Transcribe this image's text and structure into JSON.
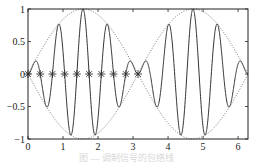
{
  "chart_data": {
    "type": "line",
    "title": "",
    "xlabel": "",
    "ylabel": "",
    "xlim": [
      0,
      6.2832
    ],
    "ylim": [
      -1,
      1
    ],
    "grid": false,
    "legend": null,
    "x_ticks": [
      0,
      1,
      2,
      3,
      4,
      5,
      6
    ],
    "x_tick_labels": [
      "0",
      "1",
      "2",
      "3",
      "4",
      "5",
      "6"
    ],
    "y_ticks": [
      -1,
      -0.5,
      0,
      0.5,
      1
    ],
    "y_tick_labels": [
      "−1",
      "−0.5",
      "0",
      "0.5",
      "1"
    ],
    "series": [
      {
        "name": "signal",
        "style": "solid",
        "color": "#333333",
        "formula": "sin(x)*sin(9x)",
        "sampled_points": [
          [
            0,
            0
          ],
          [
            0.17,
            0.17
          ],
          [
            0.52,
            -0.5
          ],
          [
            0.87,
            0.77
          ],
          [
            1.22,
            -0.94
          ],
          [
            1.57,
            1.0
          ],
          [
            1.92,
            -0.94
          ],
          [
            2.27,
            0.77
          ],
          [
            2.62,
            -0.5
          ],
          [
            2.97,
            0.17
          ],
          [
            3.14,
            0
          ],
          [
            3.32,
            0.17
          ],
          [
            3.67,
            -0.5
          ],
          [
            4.01,
            0.77
          ],
          [
            4.36,
            -0.94
          ],
          [
            4.71,
            1.0
          ],
          [
            5.06,
            -0.94
          ],
          [
            5.41,
            0.77
          ],
          [
            5.76,
            -0.5
          ],
          [
            6.11,
            0.17
          ],
          [
            6.28,
            0
          ]
        ]
      },
      {
        "name": "upper envelope",
        "style": "dotted",
        "color": "#555555",
        "formula": "|sin(x)|"
      },
      {
        "name": "lower envelope",
        "style": "dotted",
        "color": "#555555",
        "formula": "-|sin(x)|"
      },
      {
        "name": "zero markers",
        "style": "marker-star",
        "color": "#333333",
        "x": [
          0,
          0.349,
          0.698,
          1.047,
          1.396,
          1.745,
          2.094,
          2.443,
          2.793,
          3.142
        ],
        "y": [
          0,
          0,
          0,
          0,
          0,
          0,
          0,
          0,
          0,
          0
        ]
      }
    ]
  },
  "caption": "图 — 调制信号的包络线"
}
